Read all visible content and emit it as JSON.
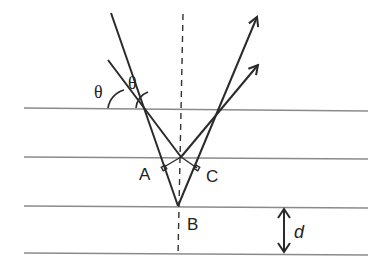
{
  "diagram": {
    "labels": {
      "theta_left": "θ",
      "theta_right": "θ",
      "point_a": "A",
      "point_b": "B",
      "point_c": "C",
      "spacing": "d"
    },
    "elements": {
      "planes": 4,
      "incident_rays": 2,
      "reflected_rays": 2,
      "normal_line": "dashed"
    },
    "caption_fragment": "26.15 Th"
  }
}
